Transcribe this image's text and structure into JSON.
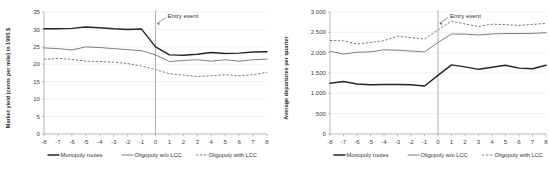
{
  "figure": {
    "background_color": "#ffffff",
    "series_colors": {
      "monopoly": "#262626",
      "oligopoly_wo_lcc": "#6e6e6e",
      "oligopoly_with_lcc": "#6e6e6e"
    },
    "legend": {
      "position": "below-axis",
      "entries": [
        {
          "label": "Monopoly routes",
          "style": "thick-solid"
        },
        {
          "label": "Oligopoly w/o LCC",
          "style": "thin-solid"
        },
        {
          "label": "Oligopoly with LCC",
          "style": "dashed"
        }
      ]
    },
    "annotation": {
      "label": "Entry event",
      "at_x": 0
    }
  },
  "chart_data": [
    {
      "type": "line",
      "panel": "left",
      "title": "",
      "xlabel": "",
      "ylabel": "Market yield (cents per mile) in 1995 $",
      "x": [
        -8,
        -7,
        -6,
        -5,
        -4,
        -3,
        -2,
        -1,
        0,
        1,
        2,
        3,
        4,
        5,
        6,
        7,
        8
      ],
      "xtick_labels": [
        "-8",
        "-7",
        "-6",
        "-5",
        "-4",
        "-3",
        "-2",
        "-1",
        "0",
        "1",
        "2",
        "3",
        "4",
        "5",
        "6",
        "7",
        "8"
      ],
      "ytick_labels": [
        "0",
        "5",
        "10",
        "15",
        "20",
        "25",
        "30",
        "35"
      ],
      "ylim": [
        0,
        35
      ],
      "xlim": [
        -8,
        8
      ],
      "grid": true,
      "annotations": [
        {
          "text": "Entry event",
          "x": 0,
          "y": 33.2
        }
      ],
      "series": [
        {
          "name": "Monopoly routes",
          "style": "thick-solid",
          "values": [
            30.2,
            30.2,
            30.3,
            30.7,
            30.5,
            30.2,
            30.0,
            30.1,
            25.0,
            22.7,
            22.6,
            22.9,
            23.4,
            23.1,
            23.2,
            23.5,
            23.6
          ]
        },
        {
          "name": "Oligopoly w/o LCC",
          "style": "thin-solid",
          "values": [
            24.7,
            24.5,
            24.1,
            25.0,
            24.8,
            24.5,
            24.2,
            23.9,
            22.7,
            20.8,
            21.1,
            21.3,
            20.9,
            21.3,
            20.9,
            21.3,
            21.5
          ]
        },
        {
          "name": "Oligopoly with LCC",
          "style": "dashed",
          "values": [
            21.4,
            21.7,
            21.4,
            20.9,
            20.8,
            20.6,
            20.2,
            19.5,
            18.5,
            17.3,
            16.9,
            16.5,
            16.7,
            17.0,
            16.7,
            17.0,
            17.7
          ]
        }
      ]
    },
    {
      "type": "line",
      "panel": "right",
      "title": "",
      "xlabel": "",
      "ylabel": "Average departures per quarter",
      "x": [
        -8,
        -7,
        -6,
        -5,
        -4,
        -3,
        -2,
        -1,
        0,
        1,
        2,
        3,
        4,
        5,
        6,
        7,
        8
      ],
      "xtick_labels": [
        "-8",
        "-7",
        "-6",
        "-5",
        "-4",
        "-3",
        "-2",
        "-1",
        "0",
        "1",
        "2",
        "3",
        "4",
        "5",
        "6",
        "7",
        "8"
      ],
      "ytick_labels": [
        "0",
        "500",
        "1.000",
        "1.500",
        "2.000",
        "2.500",
        "3.000"
      ],
      "ylim": [
        0,
        3000
      ],
      "xlim": [
        -8,
        8
      ],
      "grid": true,
      "annotations": [
        {
          "text": "Entry event",
          "x": 0,
          "y": 2850
        }
      ],
      "series": [
        {
          "name": "Monopoly routes",
          "style": "thick-solid",
          "values": [
            1250,
            1290,
            1230,
            1210,
            1215,
            1215,
            1210,
            1180,
            1440,
            1700,
            1650,
            1590,
            1640,
            1690,
            1620,
            1605,
            1690
          ]
        },
        {
          "name": "Oligopoly w/o LCC",
          "style": "thin-solid",
          "values": [
            2035,
            1965,
            2010,
            2020,
            2070,
            2060,
            2040,
            2020,
            2250,
            2460,
            2455,
            2435,
            2460,
            2470,
            2470,
            2475,
            2490
          ]
        },
        {
          "name": "Oligopoly with LCC",
          "style": "dashed",
          "values": [
            2300,
            2290,
            2215,
            2250,
            2295,
            2405,
            2370,
            2335,
            2560,
            2775,
            2705,
            2645,
            2700,
            2690,
            2670,
            2695,
            2720
          ]
        }
      ]
    }
  ]
}
